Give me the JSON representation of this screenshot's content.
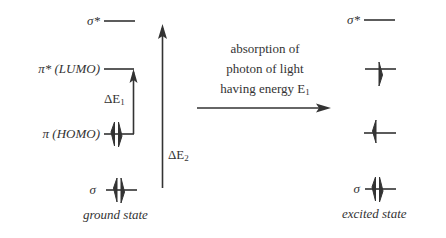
{
  "diagram": {
    "type": "molecular-orbital-energy-diagram",
    "ground_state": {
      "caption": "ground state",
      "levels": [
        {
          "id": "sigma_star",
          "label": "σ*",
          "electrons": "empty"
        },
        {
          "id": "pi_star",
          "label": "π* (LUMO)",
          "electrons": "empty"
        },
        {
          "id": "pi",
          "label": "π (HOMO)",
          "electrons": "paired (↑↓)"
        },
        {
          "id": "sigma",
          "label": "σ",
          "electrons": "paired (↑↓)"
        }
      ],
      "transitions": [
        {
          "label_main": "ΔE",
          "label_sub": "1",
          "from": "π (HOMO)",
          "to": "π* (LUMO)"
        },
        {
          "label_main": "ΔE",
          "label_sub": "2",
          "from": "σ",
          "to": "σ*"
        }
      ]
    },
    "process": {
      "line1": "absorption of",
      "line2": "photon of light",
      "line3_main": "having energy E",
      "line3_sub": "1"
    },
    "excited_state": {
      "caption": "excited state",
      "levels": [
        {
          "id": "sigma_star",
          "label": "σ*",
          "electrons": "empty"
        },
        {
          "id": "pi_star",
          "label": "",
          "electrons": "single (↓)"
        },
        {
          "id": "pi",
          "label": "",
          "electrons": "single (↑)"
        },
        {
          "id": "sigma",
          "label": "σ",
          "electrons": "paired (↑↓)"
        }
      ]
    },
    "colors": {
      "line": "#333333",
      "text": "#333333",
      "background": "#ffffff"
    }
  }
}
